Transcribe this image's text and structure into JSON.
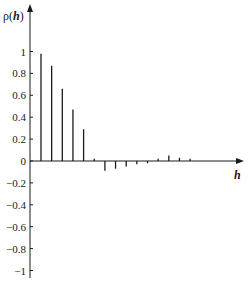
{
  "chart_data": {
    "type": "bar",
    "subtype": "stem / correlogram",
    "title": "",
    "ylabel": "ρ(h)",
    "ylabel_parts": {
      "prefix": "ρ(",
      "var": "h",
      "suffix": ")"
    },
    "xlabel": "h",
    "ylim": [
      -1,
      1
    ],
    "yticks": [
      1,
      0.8,
      0.6,
      0.4,
      0.2,
      0,
      -0.2,
      -0.4,
      -0.6,
      -0.8,
      -1
    ],
    "ytick_labels": [
      "1",
      "0.8",
      "0.6",
      "0.4",
      "0.2",
      "0",
      "-0.2",
      "-0.4",
      "-0.6",
      "-0.8",
      "-1"
    ],
    "grid": false,
    "legend": null,
    "x": [
      1,
      2,
      3,
      4,
      5,
      6,
      7,
      8,
      9,
      10,
      11,
      12,
      13,
      14,
      15
    ],
    "values": [
      0.98,
      0.87,
      0.66,
      0.47,
      0.29,
      0.02,
      -0.09,
      -0.07,
      -0.05,
      -0.03,
      -0.02,
      0.02,
      0.05,
      0.03,
      0.02
    ]
  },
  "colors": {
    "axis": "#1a1a1a",
    "bars": "#1a1a1a",
    "background": "#ffffff"
  }
}
